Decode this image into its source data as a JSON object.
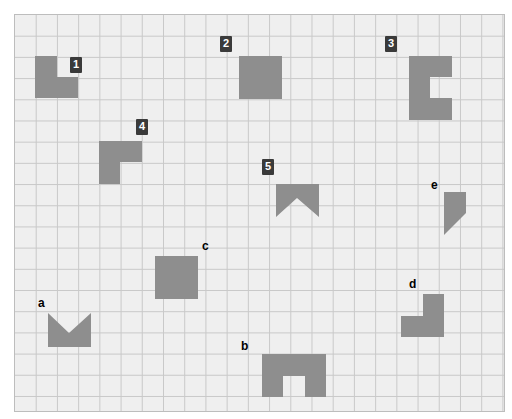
{
  "canvas": {
    "width": 512,
    "height": 419,
    "background": "#ffffff"
  },
  "grid": {
    "x": 14,
    "y": 14,
    "width": 491,
    "height": 398,
    "cell": 21.3,
    "cols": 23,
    "rows": 18.7,
    "fill": "#efefef",
    "line_color": "#c9c9c9",
    "border_color": "#bdbdbd"
  },
  "style": {
    "shape_fill": "#8e8e8e",
    "badge_bg": "#3a3a3a",
    "badge_text": "#ffffff",
    "plain_text": "#000000"
  },
  "shapes": [
    {
      "id": "shape-1",
      "label": "1",
      "label_kind": "badge",
      "label_x": 70,
      "label_y": 57,
      "kind": "triangle-trapezoid",
      "cells": {
        "col": 1,
        "row": 2,
        "w": 3,
        "h": 2
      },
      "points": "35,56 57,56 57,77 78,77 78,98 35,98"
    },
    {
      "id": "shape-2",
      "label": "2",
      "label_kind": "badge",
      "label_x": 220,
      "label_y": 36,
      "kind": "square",
      "cells": {
        "col": 10,
        "row": 2,
        "w": 2,
        "h": 2
      },
      "points": "239,56 282,56 282,99 239,99"
    },
    {
      "id": "shape-3",
      "label": "3",
      "label_kind": "badge",
      "label_x": 385,
      "label_y": 36,
      "kind": "notched-block",
      "cells": {
        "col": 19,
        "row": 2,
        "w": 2,
        "h": 3
      },
      "points": "409,56 452,56 452,77 430,77 430,98 452,98 452,120 409,120"
    },
    {
      "id": "shape-4",
      "label": "4",
      "label_kind": "badge",
      "label_x": 136,
      "label_y": 119,
      "kind": "l-shape",
      "cells": {
        "col": 4,
        "row": 6,
        "w": 2,
        "h": 2
      },
      "points": "99,141 142,141 142,162 120,162 120,184 99,184"
    },
    {
      "id": "shape-5",
      "label": "5",
      "label_kind": "badge",
      "label_x": 262,
      "label_y": 159,
      "kind": "banner-down",
      "cells": {
        "col": 13,
        "row": 8,
        "w": 2,
        "h": 2
      },
      "points": "276,184 319,184 319,217 297,198 276,217"
    },
    {
      "id": "shape-a",
      "label": "a",
      "label_kind": "plain",
      "label_x": 38,
      "label_y": 297,
      "kind": "banner-up",
      "cells": {
        "col": 1,
        "row": 14,
        "w": 2,
        "h": 2
      },
      "points": "48,313 69,333 91,313 91,347 48,347"
    },
    {
      "id": "shape-b",
      "label": "b",
      "label_kind": "plain",
      "label_x": 241,
      "label_y": 340,
      "kind": "notched-block",
      "cells": {
        "col": 11,
        "row": 16,
        "w": 3,
        "h": 2
      },
      "points": "262,354 326,354 326,397 305,397 305,376 283,376 283,397 262,397"
    },
    {
      "id": "shape-c",
      "label": "c",
      "label_kind": "plain",
      "label_x": 202,
      "label_y": 240,
      "kind": "square",
      "cells": {
        "col": 7,
        "row": 11,
        "w": 2,
        "h": 2
      },
      "points": "155,256 198,256 198,299 155,299"
    },
    {
      "id": "shape-d",
      "label": "d",
      "label_kind": "plain",
      "label_x": 409,
      "label_y": 278,
      "kind": "l-shape",
      "cells": {
        "col": 19,
        "row": 13,
        "w": 2,
        "h": 2
      },
      "points": "423,294 444,294 444,337 401,337 401,316 423,316"
    },
    {
      "id": "shape-e",
      "label": "e",
      "label_kind": "plain",
      "label_x": 431,
      "label_y": 179,
      "kind": "triangle-trapezoid",
      "cells": {
        "col": 20,
        "row": 8,
        "w": 2,
        "h": 2
      },
      "points": "444,192 466,192 466,213 466,213 444,235 444,213"
    }
  ]
}
